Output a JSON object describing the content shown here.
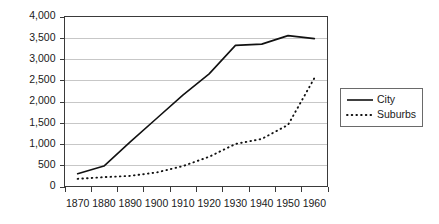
{
  "chart_data": {
    "type": "line",
    "title": "",
    "subtitle": "",
    "xlabel": "",
    "ylabel": "",
    "categories": [
      "1870",
      "1880",
      "1890",
      "1900",
      "1910",
      "1920",
      "1930",
      "1940",
      "1950",
      "1960"
    ],
    "x": [
      1870,
      1880,
      1890,
      1900,
      1910,
      1920,
      1930,
      1940,
      1950,
      1960
    ],
    "series": [
      {
        "name": "City",
        "style": "solid",
        "color": "#111111",
        "values": [
          300,
          480,
          1050,
          1600,
          2150,
          2650,
          3320,
          3350,
          3550,
          3480
        ]
      },
      {
        "name": "Suburbs",
        "style": "dotted",
        "color": "#111111",
        "values": [
          180,
          220,
          250,
          330,
          480,
          700,
          1000,
          1120,
          1450,
          2550
        ]
      }
    ],
    "ylim": [
      0,
      4000
    ],
    "ytick_values": [
      0,
      500,
      1000,
      1500,
      2000,
      2500,
      3000,
      3500,
      4000
    ],
    "ytick_labels": [
      "0",
      "500",
      "1,000",
      "1,500",
      "2,000",
      "2,500",
      "3,000",
      "3,500",
      "4,000"
    ],
    "xtick_labels": [
      "1870",
      "1880",
      "1890",
      "1900",
      "1910",
      "1920",
      "1930",
      "1940",
      "1950",
      "1960"
    ],
    "grid": "horizontal",
    "legend_position": "right",
    "legend_entries": [
      "City",
      "Suburbs"
    ]
  },
  "legend": {
    "city_label": "City",
    "suburbs_label": "Suburbs"
  },
  "colors": {
    "line": "#111111",
    "grid": "#b9b9b9",
    "frame": "#3a3a3a",
    "background": "#ffffff"
  }
}
